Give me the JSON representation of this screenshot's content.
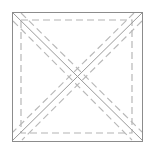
{
  "figure": {
    "title": "Quilt block construction diagram",
    "canvas": {
      "width": 155,
      "height": 152,
      "background": "#ffffff"
    },
    "colors": {
      "background": "#ffffff",
      "solid_line": "#8c8c8c",
      "solid_diagonal": "#9a9a9a",
      "dashed_line": "#b4b4b4",
      "dashed_diagonal": "#b8b8b8"
    },
    "stroke": {
      "solid_width": 1,
      "dashed_width": 1.15,
      "dash_pattern": "7 4"
    },
    "outer_square": {
      "name": "cutting-line-square",
      "style": "solid",
      "left": 12,
      "top": 12,
      "right": 143,
      "bottom": 141
    },
    "inner_square": {
      "name": "seam-allowance-square",
      "style": "dashed",
      "left": 21,
      "top": 20,
      "right": 132,
      "bottom": 133
    },
    "diagonals": [
      {
        "name": "diagonal-tl-br",
        "style": "solid",
        "x1": 12,
        "y1": 12,
        "x2": 143,
        "y2": 141
      },
      {
        "name": "diagonal-tr-bl",
        "style": "solid",
        "x1": 143,
        "y1": 12,
        "x2": 12,
        "y2": 141
      }
    ],
    "dashed_diagonals": [
      {
        "name": "dashed-diagonal-tl-br-upper",
        "x1": 21,
        "y1": 13,
        "x2": 142,
        "y2": 132
      },
      {
        "name": "dashed-diagonal-tl-br-lower",
        "x1": 13,
        "y1": 21,
        "x2": 132,
        "y2": 140
      },
      {
        "name": "dashed-diagonal-tr-bl-upper",
        "x1": 134,
        "y1": 13,
        "x2": 13,
        "y2": 132
      },
      {
        "name": "dashed-diagonal-tr-bl-lower",
        "x1": 142,
        "y1": 21,
        "x2": 22,
        "y2": 140
      }
    ],
    "center_point": {
      "name": "diagonal-intersection",
      "x": 77.5,
      "y": 76.5
    }
  }
}
